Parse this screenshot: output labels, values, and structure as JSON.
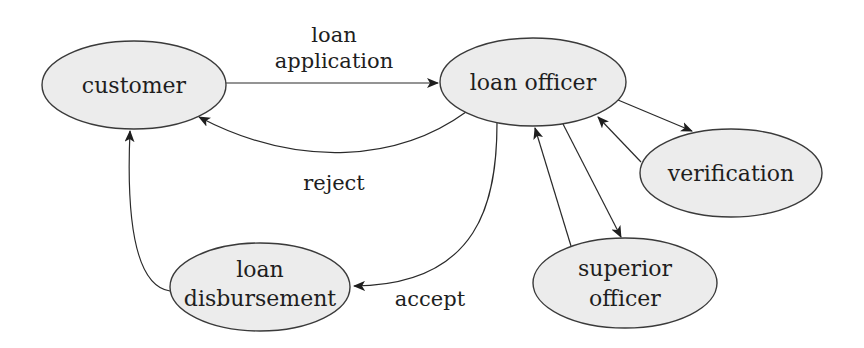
{
  "diagram": {
    "type": "workflow",
    "nodes": {
      "customer": {
        "lines": [
          "customer"
        ]
      },
      "loan_officer": {
        "lines": [
          "loan officer"
        ]
      },
      "verification": {
        "lines": [
          "verification"
        ]
      },
      "superior_officer": {
        "lines": [
          "superior",
          "officer"
        ]
      },
      "loan_disbursement": {
        "lines": [
          "loan",
          "disbursement"
        ]
      }
    },
    "edges": {
      "loan_application": {
        "from": "customer",
        "to": "loan officer",
        "label_lines": [
          "loan",
          "application"
        ]
      },
      "reject": {
        "from": "loan officer",
        "to": "customer",
        "label": "reject"
      },
      "accept": {
        "from": "loan officer",
        "to": "loan disbursement",
        "label": "accept"
      },
      "disbursement_to_customer": {
        "from": "loan disbursement",
        "to": "customer",
        "label": ""
      },
      "to_verification": {
        "from": "loan officer",
        "to": "verification",
        "label": ""
      },
      "from_verification": {
        "from": "verification",
        "to": "loan officer",
        "label": ""
      },
      "to_superior": {
        "from": "loan officer",
        "to": "superior officer",
        "label": ""
      },
      "from_superior": {
        "from": "superior officer",
        "to": "loan officer",
        "label": ""
      }
    },
    "colors": {
      "node_fill": "#ececec",
      "stroke": "#2a2a2a",
      "text": "#1e1e1e"
    }
  }
}
